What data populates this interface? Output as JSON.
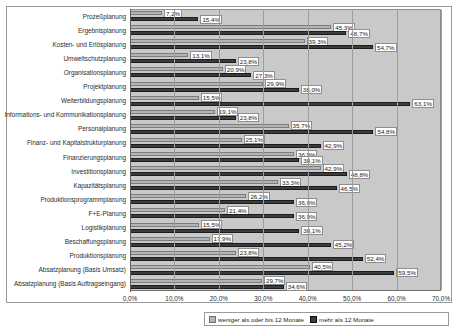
{
  "chart_data": {
    "type": "bar",
    "orientation": "horizontal",
    "title": "",
    "xlabel": "",
    "ylabel": "",
    "xlim": [
      0,
      70
    ],
    "grid": true,
    "legend_position": "bottom",
    "tick_labels": [
      "0,0%",
      "10,0%",
      "20,0%",
      "30,0%",
      "40,0%",
      "50,0%",
      "60,0%",
      "70,0%"
    ],
    "tick_values": [
      0,
      10,
      20,
      30,
      40,
      50,
      60,
      70
    ],
    "categories": [
      "Prozeßplanung",
      "Ergebnisplanung",
      "Kosten- und Erlösplanung",
      "Umweltschutzplanung",
      "Organisationsplanung",
      "Projektplanung",
      "Weiterbildungsplanung",
      "Informations- und Kommunikationsplanung",
      "Personalplanung",
      "Finanz- und Kapitalstrukturplanung",
      "Finanzierungsplanung",
      "Investitionsplanung",
      "Kapazitätsplanung",
      "Produktionsprogrammplanung",
      "F+E-Planung",
      "Logistikplanung",
      "Beschaffungsplanung",
      "Produktionsplanung",
      "Absatzplanung (Basis Umsatz)",
      "Absatzplanung (Basis Auftragseingang)"
    ],
    "series": [
      {
        "name": "weniger als oder bis 12 Monate",
        "color": "#b4b4b4",
        "values": [
          7.2,
          45.3,
          39.3,
          13.1,
          20.9,
          29.9,
          15.5,
          19.1,
          35.7,
          25.1,
          36.9,
          42.9,
          33.3,
          26.2,
          21.4,
          15.5,
          17.9,
          23.8,
          40.5,
          29.7
        ],
        "labels": [
          "7,2%",
          "45,3%",
          "39,3%",
          "13,1%",
          "20,9%",
          "29,9%",
          "15,5%",
          "19,1%",
          "35,7%",
          "25,1%",
          "36,9%",
          "42,9%",
          "33,3%",
          "26,2%",
          "21,4%",
          "15,5%",
          "17,9%",
          "23,8%",
          "40,5%",
          "29,7%"
        ]
      },
      {
        "name": "mehr als 12 Monate",
        "color": "#3c3c3c",
        "values": [
          15.4,
          48.7,
          54.7,
          23.8,
          27.3,
          38.0,
          63.1,
          23.8,
          54.8,
          42.9,
          38.1,
          48.8,
          46.5,
          36.9,
          36.9,
          38.1,
          45.2,
          52.4,
          59.5,
          34.6
        ],
        "labels": [
          "15,4%",
          "48,7%",
          "54,7%",
          "23,8%",
          "27,3%",
          "38,0%",
          "63,1%",
          "23,8%",
          "54,8%",
          "42,9%",
          "38,1%",
          "48,8%",
          "46,5%",
          "36,9%",
          "36,9%",
          "38,1%",
          "45,2%",
          "52,4%",
          "59,5%",
          "34,6%"
        ]
      }
    ]
  },
  "legend": {
    "items": [
      {
        "label": "weniger als oder bis 12 Monate"
      },
      {
        "label": "mehr als 12 Monate"
      }
    ]
  }
}
